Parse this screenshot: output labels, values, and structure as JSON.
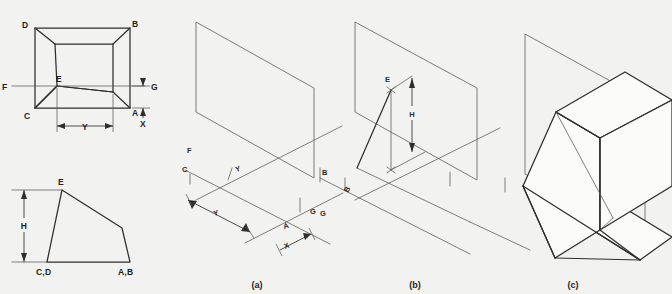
{
  "figure": {
    "background_color": "#f2f2f0",
    "line_color": "#2e2e2e",
    "plane_color": "#6e6e6e"
  },
  "orthographic": {
    "top_view": {
      "name": "top-view",
      "vertex_labels": {
        "d": "D",
        "b": "B",
        "c": "C",
        "a": "A",
        "e": "E",
        "f": "F",
        "g": "G"
      },
      "dimensions": {
        "y": "Y",
        "x": "X"
      }
    },
    "front_view": {
      "name": "front-view",
      "vertex_labels": {
        "e": "E",
        "cd": "C,D",
        "ab": "A,B"
      },
      "dimensions": {
        "h": "H"
      }
    }
  },
  "panels": [
    {
      "id": "a",
      "caption": "(a)",
      "labels": {
        "f": "F",
        "c": "C",
        "y_upper": "Y",
        "y_lower": "Y",
        "a": "A",
        "x": "X",
        "g": "G",
        "b": "B"
      }
    },
    {
      "id": "b",
      "caption": "(b)",
      "labels": {
        "e": "E",
        "h": "H",
        "b": "B",
        "g": "G"
      }
    },
    {
      "id": "c",
      "caption": "(c)",
      "labels": {}
    }
  ]
}
